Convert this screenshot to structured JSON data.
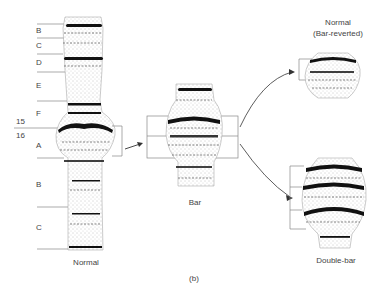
{
  "figure": {
    "panel_label": "(b)",
    "normal": {
      "caption": "Normal",
      "region_labels": [
        "B",
        "C",
        "D",
        "E",
        "F",
        "A",
        "B",
        "C"
      ],
      "band_numbers": [
        "15",
        "16"
      ]
    },
    "bar": {
      "caption": "Bar"
    },
    "reverted": {
      "caption_line1": "Normal",
      "caption_line2": "(Bar-reverted)"
    },
    "double_bar": {
      "caption": "Double-bar"
    }
  }
}
